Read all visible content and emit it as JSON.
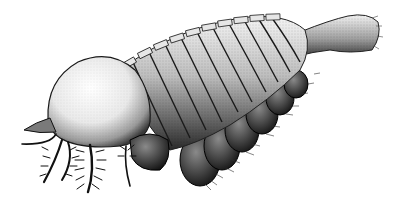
{
  "image": {
    "subject": "arthropod-illustration",
    "style": "stippled pen-and-ink",
    "background": "#ffffff",
    "ink": "#111111",
    "segment_count": 11
  }
}
